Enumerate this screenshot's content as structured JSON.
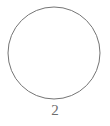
{
  "figure": {
    "type": "geometric-diagram",
    "background_color": "#ffffff",
    "shapes": [
      {
        "name": "circle",
        "icon": "circle-outline",
        "center_x": 54,
        "center_y": 53,
        "radius": 46,
        "stroke_color": "#757575",
        "stroke_width": 1,
        "fill": "none",
        "label": "2"
      }
    ],
    "label": {
      "text": "2",
      "color": "#6d6d6d",
      "position": "below-circle",
      "center_x": 54,
      "top_y": 102
    }
  }
}
